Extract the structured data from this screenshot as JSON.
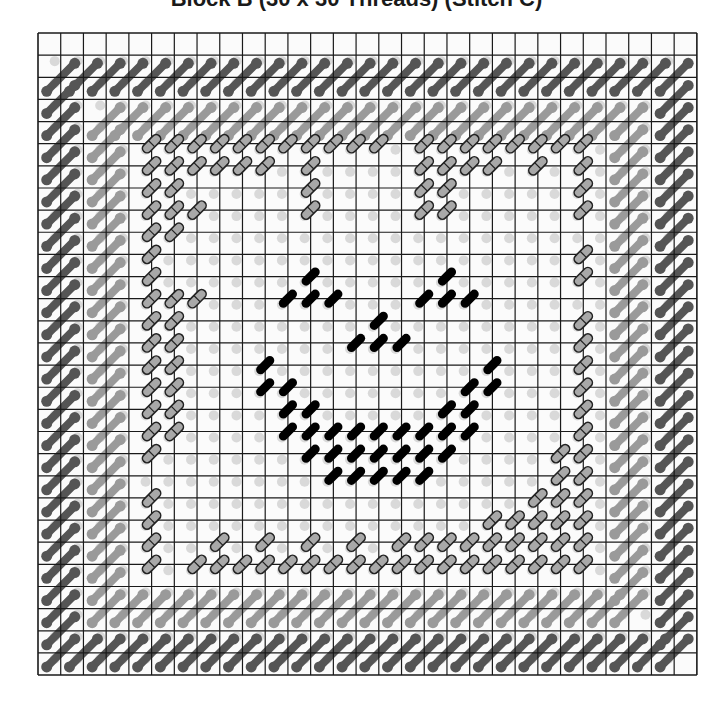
{
  "title": "Block B (30 x 30 Threads) (Stitch C)",
  "chart_data": {
    "type": "table",
    "title": "Block B (30 x 30 Threads) (Stitch C)",
    "grid": {
      "threads_x": 30,
      "threads_y": 30,
      "cells": 29
    },
    "legend": [],
    "colors": {
      "dark_border": "#555555",
      "light_border": "#9a9a9a",
      "outlined_fill": "#a8a8a8",
      "face": "#000000",
      "gridline": "#1a1a1a"
    },
    "stitch_layers": {
      "dark_border_ring": {
        "top_row": 2,
        "bottom_row": 28,
        "left_col": 1,
        "right_col": 28
      },
      "light_border_ring": {
        "top_row": 4,
        "bottom_row": 26,
        "left_col": 3,
        "right_col": 26
      },
      "outlined_stitches": [
        [
          5,
          5
        ],
        [
          6,
          5
        ],
        [
          7,
          5
        ],
        [
          8,
          5
        ],
        [
          9,
          5
        ],
        [
          10,
          5
        ],
        [
          11,
          5
        ],
        [
          12,
          5
        ],
        [
          13,
          5
        ],
        [
          14,
          5
        ],
        [
          15,
          5
        ],
        [
          17,
          5
        ],
        [
          18,
          5
        ],
        [
          19,
          5
        ],
        [
          20,
          5
        ],
        [
          21,
          5
        ],
        [
          22,
          5
        ],
        [
          23,
          5
        ],
        [
          24,
          5
        ],
        [
          5,
          6
        ],
        [
          6,
          6
        ],
        [
          7,
          6
        ],
        [
          8,
          6
        ],
        [
          9,
          6
        ],
        [
          10,
          6
        ],
        [
          12,
          6
        ],
        [
          17,
          6
        ],
        [
          18,
          6
        ],
        [
          19,
          6
        ],
        [
          20,
          6
        ],
        [
          22,
          6
        ],
        [
          24,
          6
        ],
        [
          5,
          7
        ],
        [
          6,
          7
        ],
        [
          12,
          7
        ],
        [
          17,
          7
        ],
        [
          18,
          7
        ],
        [
          24,
          7
        ],
        [
          5,
          8
        ],
        [
          6,
          8
        ],
        [
          7,
          8
        ],
        [
          12,
          8
        ],
        [
          17,
          8
        ],
        [
          18,
          8
        ],
        [
          24,
          8
        ],
        [
          5,
          9
        ],
        [
          6,
          9
        ],
        [
          5,
          10
        ],
        [
          24,
          10
        ],
        [
          5,
          11
        ],
        [
          24,
          11
        ],
        [
          5,
          12
        ],
        [
          6,
          12
        ],
        [
          7,
          12
        ],
        [
          5,
          13
        ],
        [
          6,
          13
        ],
        [
          24,
          13
        ],
        [
          5,
          14
        ],
        [
          6,
          14
        ],
        [
          24,
          14
        ],
        [
          5,
          15
        ],
        [
          6,
          15
        ],
        [
          24,
          15
        ],
        [
          5,
          16
        ],
        [
          6,
          16
        ],
        [
          24,
          16
        ],
        [
          5,
          17
        ],
        [
          6,
          17
        ],
        [
          24,
          17
        ],
        [
          5,
          18
        ],
        [
          6,
          18
        ],
        [
          24,
          18
        ],
        [
          5,
          19
        ],
        [
          23,
          19
        ],
        [
          24,
          19
        ],
        [
          23,
          20
        ],
        [
          24,
          20
        ],
        [
          5,
          21
        ],
        [
          22,
          21
        ],
        [
          23,
          21
        ],
        [
          24,
          21
        ],
        [
          5,
          22
        ],
        [
          20,
          22
        ],
        [
          21,
          22
        ],
        [
          22,
          22
        ],
        [
          23,
          22
        ],
        [
          24,
          22
        ],
        [
          5,
          23
        ],
        [
          8,
          23
        ],
        [
          10,
          23
        ],
        [
          12,
          23
        ],
        [
          14,
          23
        ],
        [
          16,
          23
        ],
        [
          17,
          23
        ],
        [
          18,
          23
        ],
        [
          19,
          23
        ],
        [
          20,
          23
        ],
        [
          21,
          23
        ],
        [
          22,
          23
        ],
        [
          23,
          23
        ],
        [
          24,
          23
        ],
        [
          5,
          24
        ],
        [
          7,
          24
        ],
        [
          8,
          24
        ],
        [
          9,
          24
        ],
        [
          10,
          24
        ],
        [
          11,
          24
        ],
        [
          12,
          24
        ],
        [
          13,
          24
        ],
        [
          14,
          24
        ],
        [
          15,
          24
        ],
        [
          16,
          24
        ],
        [
          17,
          24
        ],
        [
          18,
          24
        ],
        [
          19,
          24
        ],
        [
          20,
          24
        ],
        [
          21,
          24
        ],
        [
          22,
          24
        ],
        [
          23,
          24
        ],
        [
          24,
          24
        ]
      ],
      "face_stitches": [
        [
          12,
          11
        ],
        [
          11,
          12
        ],
        [
          12,
          12
        ],
        [
          13,
          12
        ],
        [
          18,
          11
        ],
        [
          17,
          12
        ],
        [
          18,
          12
        ],
        [
          19,
          12
        ],
        [
          15,
          13
        ],
        [
          14,
          14
        ],
        [
          15,
          14
        ],
        [
          16,
          14
        ],
        [
          10,
          15
        ],
        [
          20,
          15
        ],
        [
          10,
          16
        ],
        [
          11,
          16
        ],
        [
          19,
          16
        ],
        [
          20,
          16
        ],
        [
          11,
          17
        ],
        [
          12,
          17
        ],
        [
          18,
          17
        ],
        [
          19,
          17
        ],
        [
          11,
          18
        ],
        [
          12,
          18
        ],
        [
          13,
          18
        ],
        [
          14,
          18
        ],
        [
          15,
          18
        ],
        [
          16,
          18
        ],
        [
          17,
          18
        ],
        [
          18,
          18
        ],
        [
          19,
          18
        ],
        [
          12,
          19
        ],
        [
          13,
          19
        ],
        [
          14,
          19
        ],
        [
          15,
          19
        ],
        [
          16,
          19
        ],
        [
          17,
          19
        ],
        [
          18,
          19
        ],
        [
          13,
          20
        ],
        [
          14,
          20
        ],
        [
          15,
          20
        ],
        [
          16,
          20
        ],
        [
          17,
          20
        ]
      ]
    }
  }
}
